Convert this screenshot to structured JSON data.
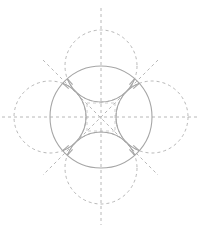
{
  "diagram": {
    "center": {
      "x": 101,
      "y": 117
    },
    "colors": {
      "dashed_stroke": "#b8b8b8",
      "solid_stroke": "#a6a6a6",
      "background": "#ffffff"
    },
    "main_circle": {
      "cx": 101,
      "cy": 117,
      "r": 51
    },
    "construction_circles": [
      {
        "name": "top",
        "cx": 101,
        "cy": 66,
        "r": 36
      },
      {
        "name": "bottom",
        "cx": 101,
        "cy": 168,
        "r": 36
      },
      {
        "name": "left",
        "cx": 50,
        "cy": 117,
        "r": 36
      },
      {
        "name": "right",
        "cx": 152,
        "cy": 117,
        "r": 36
      }
    ],
    "axes": [
      {
        "name": "vertical",
        "x1": 101,
        "y1": 8,
        "x2": 101,
        "y2": 225
      },
      {
        "name": "horizontal",
        "x1": 2,
        "y1": 117,
        "x2": 197,
        "y2": 117
      },
      {
        "name": "diagonal-1",
        "x1": 43,
        "y1": 60,
        "x2": 158,
        "y2": 175
      },
      {
        "name": "diagonal-2",
        "x1": 158,
        "y1": 60,
        "x2": 43,
        "y2": 175
      }
    ]
  }
}
